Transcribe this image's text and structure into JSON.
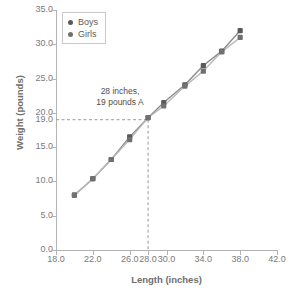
{
  "chart_data": {
    "type": "line",
    "title": "",
    "xlabel": "Length (inches)",
    "ylabel": "Weight (pounds)",
    "xlim": [
      18.0,
      42.0
    ],
    "ylim": [
      0.0,
      35.0
    ],
    "xticks": [
      "18.0",
      "22.0",
      "26.0",
      "28.0",
      "30.0",
      "34.0",
      "38.0",
      "42.0"
    ],
    "xtick_values": [
      18.0,
      22.0,
      26.0,
      28.0,
      30.0,
      34.0,
      38.0,
      42.0
    ],
    "yticks": [
      "0.0",
      "5.0",
      "10.0",
      "15.0",
      "19.0",
      "20.0",
      "25.0",
      "30.0",
      "35.0"
    ],
    "ytick_values": [
      0.0,
      5.0,
      10.0,
      15.0,
      19.0,
      20.0,
      25.0,
      30.0,
      35.0
    ],
    "grid": false,
    "legend_position": "upper-left",
    "marker": "square",
    "series": [
      {
        "name": "Boys",
        "color": "#595959",
        "x": [
          20.0,
          22.0,
          24.0,
          26.0,
          28.0,
          29.7,
          32.0,
          34.0,
          36.0,
          38.0
        ],
        "values": [
          8.0,
          10.4,
          13.2,
          16.5,
          19.3,
          21.5,
          24.1,
          26.9,
          29.0,
          32.0
        ]
      },
      {
        "name": "Girls",
        "color": "#707070",
        "x": [
          20.0,
          22.0,
          24.0,
          26.0,
          28.0,
          29.7,
          32.0,
          34.0,
          36.0,
          38.0
        ],
        "values": [
          8.0,
          10.4,
          13.2,
          16.1,
          19.3,
          21.0,
          23.9,
          26.1,
          28.9,
          31.0
        ]
      }
    ],
    "annotations": [
      {
        "name": "highlight-point",
        "text_line1": "28 inches,",
        "text_line2": "19 pounds A",
        "x": 28.0,
        "y": 19.0,
        "guide_lines": "dashed"
      }
    ]
  },
  "legend": {
    "items": [
      {
        "label": "Boys",
        "color": "#595959"
      },
      {
        "label": "Girls",
        "color": "#707070"
      }
    ]
  },
  "axes": {
    "x_title": "Length (inches)",
    "y_title": "Weight (pounds)"
  },
  "colors": {
    "axis": "#b4b4b4",
    "tick_text": "#7a7a7a",
    "title_text": "#6e6e6e",
    "guide": "#9a9a9a",
    "background": "#ffffff"
  }
}
